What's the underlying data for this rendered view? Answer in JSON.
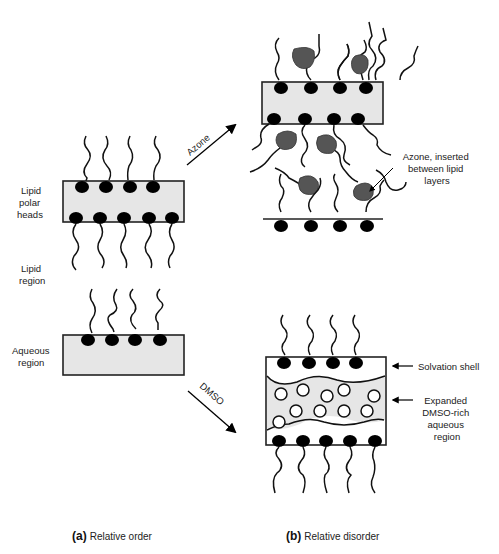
{
  "figure": {
    "panel_a": {
      "caption_letter": "(a)",
      "caption_text": "Relative order",
      "labels": {
        "lipid_polar_heads": [
          "Lipid",
          "polar",
          "heads"
        ],
        "lipid_region": [
          "Lipid",
          "region"
        ],
        "aqueous_region": [
          "Aqueous",
          "region"
        ]
      }
    },
    "panel_b": {
      "caption_letter": "(b)",
      "caption_text": "Relative disorder",
      "azone_annotation": [
        "Azone, inserted",
        "between lipid",
        "layers"
      ],
      "solvation_shell": "Solvation shell",
      "dmso_region": [
        "Expanded",
        "DMSO-rich",
        "aqueous",
        "region"
      ]
    },
    "arrows": {
      "azone": "Azone",
      "dmso": "DMSO"
    },
    "colors": {
      "membrane_fill": "#e6e6e6",
      "azone_fill": "#555555",
      "head_fill": "#000000"
    }
  }
}
